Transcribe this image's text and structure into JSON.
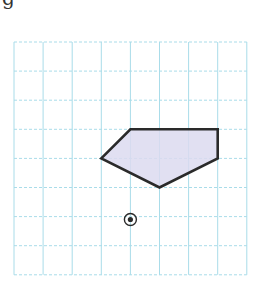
{
  "caption": "g",
  "grid": {
    "origin_x": 14,
    "origin_y": 42,
    "cell": 29.1,
    "cols": 8,
    "rows": 8,
    "line_color": "#a9dce9",
    "dash": "3,2"
  },
  "shape": {
    "vertices_grid": [
      [
        4,
        3
      ],
      [
        7,
        3
      ],
      [
        7,
        4
      ],
      [
        5,
        5
      ],
      [
        3,
        4
      ]
    ],
    "fill": "#dcdaf0",
    "stroke": "#2a2a2a",
    "stroke_width": 2.6
  },
  "center_marker": {
    "grid": [
      4,
      6.1
    ],
    "outer_radius": 6,
    "inner_radius": 2.6,
    "color": "#2a2a2a"
  }
}
